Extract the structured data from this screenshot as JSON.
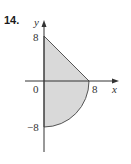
{
  "problem": {
    "number": "14."
  },
  "diagram": {
    "type": "region-in-plane",
    "axes": {
      "x_label": "x",
      "y_label": "y",
      "origin_label": "0"
    },
    "tick_labels": {
      "y_top": "8",
      "y_bottom": "−8",
      "x_right": "8"
    },
    "region": {
      "description": "Shaded region bounded by the y-axis, the line from (0,8) to (8,0), and the quarter circle from (8,0) to (0,-8)",
      "vertices": [
        [
          0,
          8
        ],
        [
          8,
          0
        ],
        [
          0,
          -8
        ]
      ],
      "upper_boundary": "line y = 8 - x",
      "lower_boundary": "arc x^2 + y^2 = 64, x >= 0, y <= 0",
      "fill_color": "#d9d9d9",
      "stroke_color": "#555555"
    },
    "colors": {
      "axis": "#333333",
      "text": "#333333"
    }
  }
}
